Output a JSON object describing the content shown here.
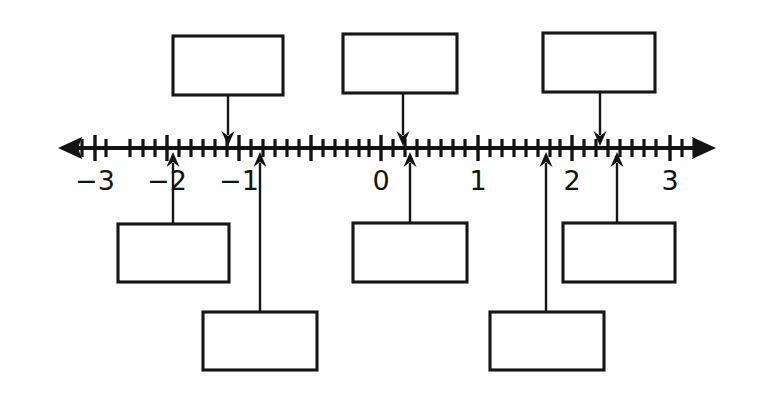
{
  "figure": {
    "background_color": "#fefefe",
    "ink_color": "#131313",
    "width": 759,
    "height": 401
  },
  "number_line": {
    "y": 148,
    "left_tip_x": 58,
    "right_tip_x": 716,
    "left_end_style": "arrow",
    "right_end_style": "arrow",
    "minor_ticks_per_interval": 3,
    "minor_tick_step_px": 24,
    "major_tick_half_height": 13,
    "minor_tick_half_height": 9,
    "labels": [
      {
        "text": "−3",
        "value": -3,
        "x": 95,
        "y": 190
      },
      {
        "text": "−2",
        "value": -2,
        "x": 167,
        "y": 190
      },
      {
        "text": "−1",
        "value": -1,
        "x": 239,
        "y": 190
      },
      {
        "text": "0",
        "value": 0,
        "x": 381,
        "y": 190
      },
      {
        "text": "1",
        "value": 1,
        "x": 478,
        "y": 190
      },
      {
        "text": "2",
        "value": 2,
        "x": 572,
        "y": 190
      },
      {
        "text": "3",
        "value": 3,
        "x": 670,
        "y": 190
      }
    ],
    "major_tick_x": [
      95,
      167,
      239,
      311,
      381,
      478,
      572,
      670
    ],
    "minor_tick_x": [
      82,
      106,
      130,
      143,
      155,
      179,
      191,
      203,
      215,
      227,
      251,
      263,
      275,
      287,
      299,
      323,
      335,
      347,
      359,
      369,
      393,
      405,
      417,
      429,
      441,
      453,
      465,
      490,
      502,
      514,
      526,
      538,
      550,
      560,
      584,
      596,
      608,
      620,
      632,
      644,
      656,
      682,
      694
    ]
  },
  "boxes": {
    "top_row": [
      {
        "id": "top-box-1",
        "x": 173,
        "y": 36,
        "w": 110,
        "h": 59,
        "value": "",
        "arrow_x": 228,
        "arrow_tip_y": 146,
        "direction": "down"
      },
      {
        "id": "top-box-2",
        "x": 343,
        "y": 34,
        "w": 114,
        "h": 59,
        "value": "",
        "arrow_x": 403,
        "arrow_tip_y": 146,
        "direction": "down"
      },
      {
        "id": "top-box-3",
        "x": 543,
        "y": 33,
        "w": 112,
        "h": 59,
        "value": "",
        "arrow_x": 600,
        "arrow_tip_y": 146,
        "direction": "down"
      }
    ],
    "middle_row": [
      {
        "id": "mid-box-1",
        "x": 118,
        "y": 224,
        "w": 111,
        "h": 58,
        "value": "",
        "arrow_x": 173,
        "arrow_tip_y": 152,
        "direction": "up"
      },
      {
        "id": "mid-box-2",
        "x": 353,
        "y": 223,
        "w": 114,
        "h": 59,
        "value": "",
        "arrow_x": 410,
        "arrow_tip_y": 152,
        "direction": "up"
      },
      {
        "id": "mid-box-3",
        "x": 563,
        "y": 223,
        "w": 112,
        "h": 59,
        "value": "",
        "arrow_x": 617,
        "arrow_tip_y": 152,
        "direction": "up"
      }
    ],
    "bottom_row": [
      {
        "id": "bottom-box-1",
        "x": 203,
        "y": 312,
        "w": 114,
        "h": 58,
        "value": "",
        "arrow_x": 260,
        "arrow_tip_y": 152,
        "direction": "up"
      },
      {
        "id": "bottom-box-2",
        "x": 490,
        "y": 312,
        "w": 114,
        "h": 58,
        "value": "",
        "arrow_x": 546,
        "arrow_tip_y": 152,
        "direction": "up"
      }
    ]
  },
  "chart_data": {
    "type": "line",
    "xlabel": "",
    "ylabel": "",
    "xlim": [
      -3.9,
      3.5
    ],
    "categories": [
      "-3",
      "-2",
      "-1",
      "0",
      "1",
      "2",
      "3"
    ],
    "values": [
      -3,
      -2,
      -1,
      0,
      1,
      2,
      3
    ],
    "grid": false,
    "legend": "none",
    "markers": [
      {
        "label": "",
        "direction": "down",
        "approx_value": -1.25,
        "pixel_x": 228
      },
      {
        "label": "",
        "direction": "down",
        "approx_value": 0.25,
        "pixel_x": 403
      },
      {
        "label": "",
        "direction": "down",
        "approx_value": 2.25,
        "pixel_x": 600
      },
      {
        "label": "",
        "direction": "up",
        "approx_value": -1.9,
        "pixel_x": 173
      },
      {
        "label": "",
        "direction": "up",
        "approx_value": 0.3,
        "pixel_x": 410
      },
      {
        "label": "",
        "direction": "up",
        "approx_value": 2.45,
        "pixel_x": 617
      },
      {
        "label": "",
        "direction": "up",
        "approx_value": -0.75,
        "pixel_x": 260
      },
      {
        "label": "",
        "direction": "up",
        "approx_value": 1.7,
        "pixel_x": 546
      }
    ]
  }
}
